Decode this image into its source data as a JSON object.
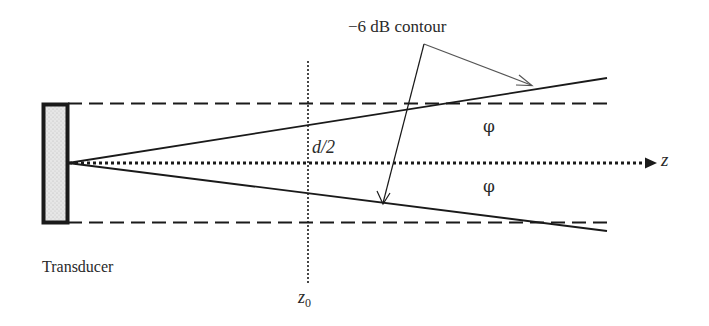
{
  "diagram": {
    "labels": {
      "contour": "−6 dB contour",
      "half_width": "d/2",
      "phi_upper": "φ",
      "phi_lower": "φ",
      "axis": "z",
      "transducer": "Transducer",
      "near_field_base": "z",
      "near_field_sub": "0"
    },
    "colors": {
      "stroke": "#1a1a1a",
      "leader": "#555555",
      "transducer_fill": "#e4e4e4",
      "background": "#ffffff"
    },
    "elements": {
      "transducer": {
        "x": 42,
        "y": 103,
        "width": 26,
        "height": 120
      },
      "top_boundary_y": 103,
      "bottom_boundary_y": 222,
      "axis_y": 163,
      "near_field_x": 308,
      "beam_origin": {
        "x": 68,
        "y": 163
      },
      "beam_upper_end": {
        "x": 607,
        "y": 78
      },
      "beam_lower_end": {
        "x": 607,
        "y": 231
      },
      "leader_origin": {
        "x": 424,
        "y": 44
      }
    }
  }
}
